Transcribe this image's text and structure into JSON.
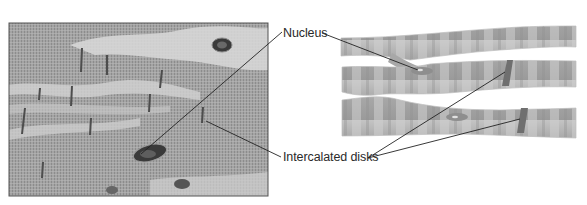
{
  "figure": {
    "panels": [
      {
        "kind": "micrograph",
        "description": "Light micrograph of striated cardiac muscle with branching fibers"
      },
      {
        "kind": "illustration",
        "description": "Schematic of branching cardiac muscle fibers with striations"
      }
    ],
    "labels": {
      "nucleus": "Nucleus",
      "intercalated_disks": "Intercalated disks"
    },
    "colors": {
      "photo_base": "#a9a9a9",
      "photo_light": "#d6d6d6",
      "fiber_base": "#a8a8a8",
      "fiber_light": "#d2d2d2",
      "disk": "#6f6f6f",
      "leader_line": "#222222",
      "label_text": "#2a2a2a"
    }
  }
}
